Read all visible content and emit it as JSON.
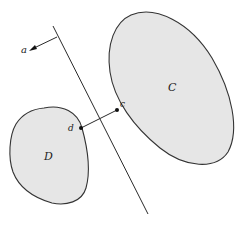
{
  "figure": {
    "sets": [
      {
        "id": "C",
        "label": "C"
      },
      {
        "id": "D",
        "label": "D"
      }
    ],
    "points": [
      {
        "id": "c",
        "label": "c"
      },
      {
        "id": "d",
        "label": "d"
      }
    ],
    "normal_vector": {
      "label": "a"
    },
    "colors": {
      "set_fill": "#e6e6e6",
      "outline": "#333333",
      "line": "#2a2a2a",
      "point": "#111111",
      "background": "#ffffff"
    }
  }
}
